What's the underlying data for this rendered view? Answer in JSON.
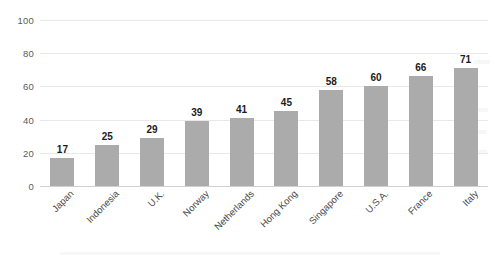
{
  "chart_data": {
    "type": "bar",
    "title": "",
    "subtitle": "",
    "xlabel": "",
    "ylabel": "",
    "ylim": [
      0,
      100
    ],
    "yticks": [
      0,
      20,
      40,
      60,
      80,
      100
    ],
    "ytick_labels": [
      "0",
      "20",
      "40",
      "60",
      "80",
      "100"
    ],
    "grid": true,
    "legend": false,
    "legend_position": "none",
    "categories": [
      "Japan",
      "Indonesia",
      "U.K.",
      "Norway",
      "Netherlands",
      "Hong Kong",
      "Singapore",
      "U.S.A.",
      "France",
      "Italy"
    ],
    "values": [
      17,
      25,
      29,
      39,
      41,
      45,
      58,
      60,
      66,
      71
    ],
    "value_labels": [
      "17",
      "25",
      "29",
      "39",
      "41",
      "45",
      "58",
      "60",
      "66",
      "71"
    ],
    "bar_color": "#ababab",
    "gridline_color": "#e8e8e8",
    "axis_color": "#d0d0d0",
    "value_label_color": "#1c1c1c",
    "tick_label_color": "#5a5a5a",
    "background_color": "#ffffff",
    "category_label_rotation": -45
  }
}
